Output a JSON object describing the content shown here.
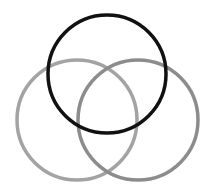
{
  "diagram": {
    "type": "venn",
    "background": "#ffffff",
    "circles": [
      {
        "name": "top",
        "cx": 107,
        "cy": 74,
        "r": 59,
        "stroke": "#111111",
        "stroke_width": 3.5
      },
      {
        "name": "bottom-left",
        "cx": 77,
        "cy": 120,
        "r": 60,
        "stroke": "#a3a3a3",
        "stroke_width": 3.5
      },
      {
        "name": "bottom-right",
        "cx": 138,
        "cy": 120,
        "r": 60,
        "stroke": "#8c8c8c",
        "stroke_width": 3.5
      }
    ]
  }
}
